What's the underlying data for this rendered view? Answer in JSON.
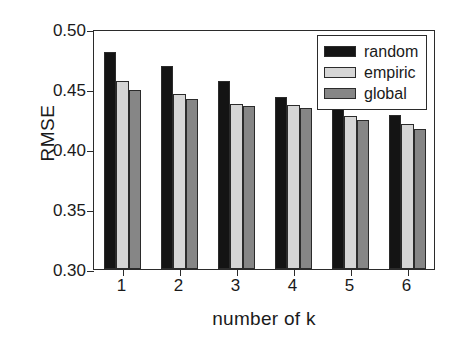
{
  "chart_data": {
    "type": "bar",
    "title": "",
    "xlabel": "number of k",
    "ylabel": "RMSE",
    "categories": [
      "1",
      "2",
      "3",
      "4",
      "5",
      "6"
    ],
    "ylim": [
      0.3,
      0.5
    ],
    "yticks": [
      "0.30",
      "0.35",
      "0.40",
      "0.45",
      "0.50"
    ],
    "ytick_values": [
      0.3,
      0.35,
      0.4,
      0.45,
      0.5
    ],
    "grid": false,
    "legend_position": "top-right",
    "series": [
      {
        "name": "random",
        "color": "#141414",
        "values": [
          0.481,
          0.469,
          0.457,
          0.443,
          0.433,
          0.428
        ]
      },
      {
        "name": "empiric",
        "color": "#d6d6d6",
        "values": [
          0.457,
          0.446,
          0.4375,
          0.4365,
          0.4275,
          0.4205
        ]
      },
      {
        "name": "global",
        "color": "#868686",
        "values": [
          0.4495,
          0.4415,
          0.436,
          0.4345,
          0.4245,
          0.4165
        ]
      }
    ]
  },
  "legend": {
    "items": [
      {
        "label": "random",
        "swatch": "random"
      },
      {
        "label": "empiric",
        "swatch": "empiric"
      },
      {
        "label": "global",
        "swatch": "global"
      }
    ]
  }
}
